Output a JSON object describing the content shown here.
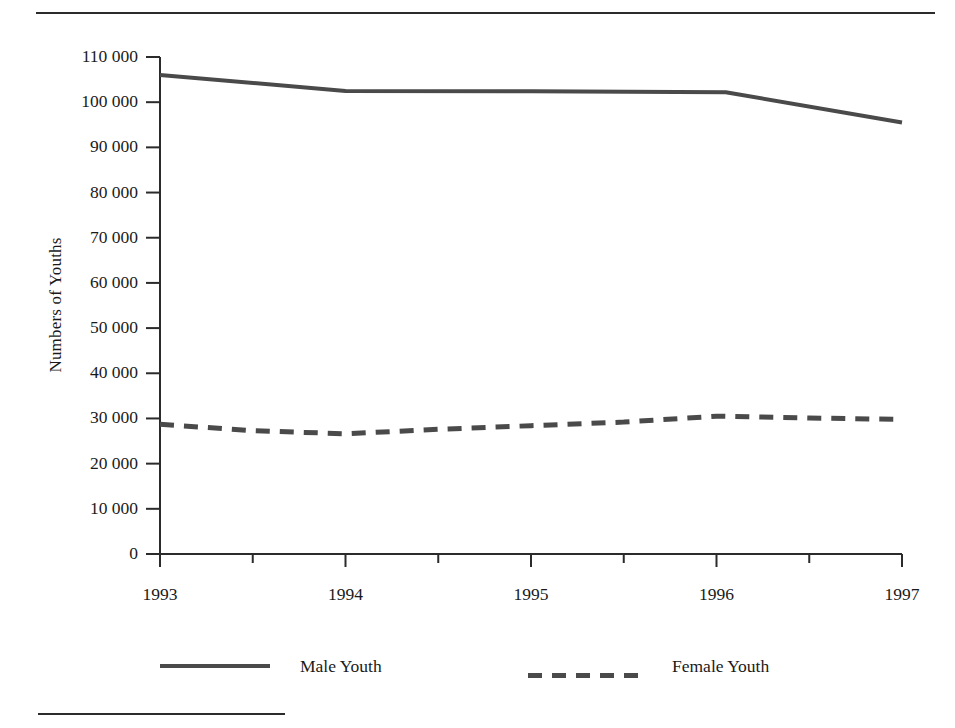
{
  "figure": {
    "y_axis_title": "Numbers of Youths",
    "top_rule": "horizontal-rule",
    "footnote_rule": "footnote-rule"
  },
  "legend": {
    "items": [
      {
        "label": "Male Youth",
        "style": "solid",
        "color": "#4a4a4a"
      },
      {
        "label": "Female Youth",
        "style": "dashed",
        "color": "#4a4a4a"
      }
    ]
  },
  "chart_data": {
    "type": "line",
    "title": "",
    "xlabel": "",
    "ylabel": "Numbers of Youths",
    "x": [
      1993,
      1994,
      1995,
      1996,
      1997
    ],
    "categories": [
      "1993",
      "1994",
      "1995",
      "1996",
      "1997"
    ],
    "xtick_labels": [
      "1993",
      "1994",
      "1995",
      "1996",
      "1997"
    ],
    "ytick_labels": [
      "0",
      "10 000",
      "20 000",
      "30 000",
      "40 000",
      "50 000",
      "60 000",
      "70 000",
      "80 000",
      "90 000",
      "100 000",
      "110 000"
    ],
    "ytick_values": [
      0,
      10000,
      20000,
      30000,
      40000,
      50000,
      60000,
      70000,
      80000,
      90000,
      100000,
      110000
    ],
    "xlim": [
      1993,
      1997
    ],
    "ylim": [
      0,
      110000
    ],
    "grid": false,
    "minor_x_ticks": true,
    "minor_x_tick_interval": 0.5,
    "legend_position": "bottom",
    "series": [
      {
        "name": "Male Youth",
        "style": "solid",
        "color": "#4a4a4a",
        "values": [
          106000,
          102500,
          102400,
          102200,
          95500
        ],
        "vertices_x": [
          1993,
          1994,
          1995,
          1996.05,
          1997
        ],
        "vertices_y": [
          106000,
          102500,
          102400,
          102200,
          95500
        ]
      },
      {
        "name": "Female Youth",
        "style": "dashed",
        "color": "#4a4a4a",
        "values": [
          28700,
          26600,
          28400,
          30500,
          29800
        ],
        "vertices_x": [
          1993,
          1993.5,
          1994,
          1994.5,
          1995,
          1995.5,
          1996,
          1996.5,
          1997
        ],
        "vertices_y": [
          28700,
          27300,
          26600,
          27600,
          28400,
          29200,
          30500,
          30100,
          29800
        ]
      }
    ]
  }
}
